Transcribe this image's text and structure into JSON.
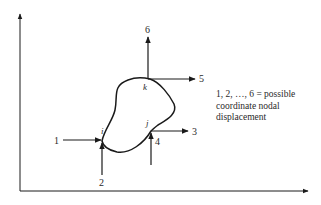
{
  "diagram": {
    "type": "finite-element-node-displacement",
    "nodes": [
      {
        "id": "i",
        "label": "i"
      },
      {
        "id": "j",
        "label": "j"
      },
      {
        "id": "k",
        "label": "k"
      }
    ],
    "displacements": [
      {
        "number": "1",
        "node": "i",
        "direction": "horizontal"
      },
      {
        "number": "2",
        "node": "i",
        "direction": "vertical"
      },
      {
        "number": "3",
        "node": "j",
        "direction": "horizontal"
      },
      {
        "number": "4",
        "node": "j",
        "direction": "vertical"
      },
      {
        "number": "5",
        "node": "k",
        "direction": "horizontal"
      },
      {
        "number": "6",
        "node": "k",
        "direction": "vertical"
      }
    ],
    "caption_lines": [
      "1, 2, …, 6 = possible",
      "coordinate nodal",
      "displacement"
    ],
    "colors": {
      "stroke": "#1a1a1a",
      "text": "#2a2a2a",
      "background": "#ffffff"
    }
  }
}
